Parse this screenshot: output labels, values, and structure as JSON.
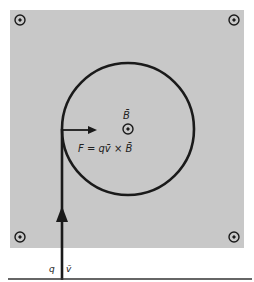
{
  "diagram": {
    "field_region_color": "#c8c8c8",
    "stroke_color": "#1a1a1a",
    "field_symbol": "out-of-page (dot in circle)",
    "corner_markers": [
      "top-left",
      "top-right",
      "bottom-left",
      "bottom-right"
    ],
    "labels": {
      "field": "B̄",
      "force_equation": "F = qv̄ × B̄",
      "charge": "q",
      "velocity": "v̄"
    }
  }
}
